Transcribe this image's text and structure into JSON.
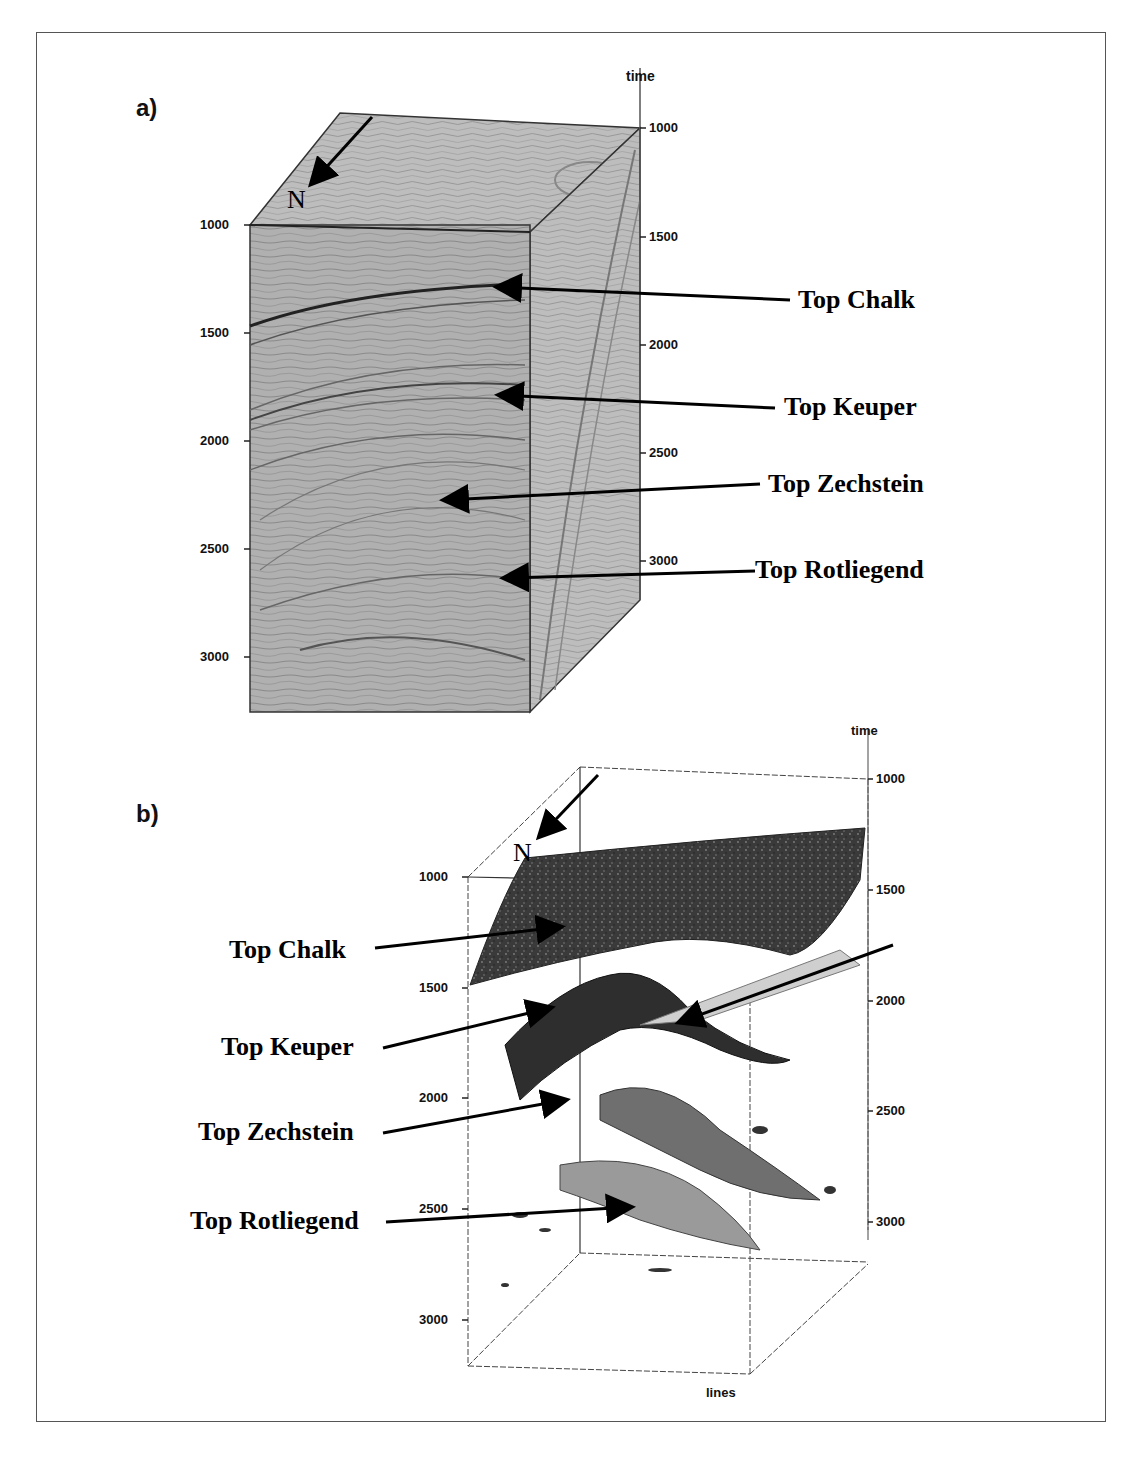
{
  "figure": {
    "panel_a": {
      "label": "a)",
      "axis_title": "time",
      "north_label": "N",
      "left_axis_ticks": [
        "1000",
        "1500",
        "2000",
        "2500",
        "3000"
      ],
      "right_axis_ticks": [
        "1000",
        "1500",
        "2000",
        "2500",
        "3000"
      ],
      "horizons": [
        "Top Chalk",
        "Top Keuper",
        "Top Zechstein",
        "Top Rotliegend"
      ]
    },
    "panel_b": {
      "label": "b)",
      "axis_title": "time",
      "bottom_axis_title": "lines",
      "north_label": "N",
      "left_axis_ticks": [
        "1000",
        "1500",
        "2000",
        "2500",
        "3000"
      ],
      "right_axis_ticks": [
        "1000",
        "1500",
        "2000",
        "2500",
        "3000"
      ],
      "horizons": [
        "Top Chalk",
        "Top Keuper",
        "Top Zechstein",
        "Top Rotliegend"
      ]
    }
  },
  "colors": {
    "seismic_gray": "#a9a9a9",
    "frame": "#555555",
    "ink": "#000000"
  }
}
